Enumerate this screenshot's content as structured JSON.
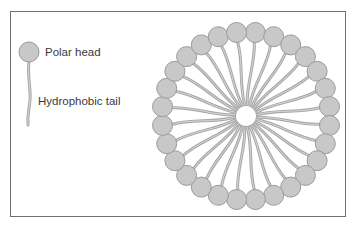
{
  "diagram": {
    "legend": {
      "polar_head_label": "Polar head",
      "tail_label": "Hydrophobic tail"
    },
    "micelle": {
      "molecule_count": 28,
      "center": [
        246,
        116
      ],
      "head_ring_radius": 84,
      "head_radius": 10,
      "core_radius": 10
    },
    "colors": {
      "head_fill": "#c8c8c8",
      "head_stroke": "#9a9a9a",
      "tail": "#a8a8a8",
      "frame": "#6e6e6e",
      "text": "#3a3a3a"
    }
  }
}
